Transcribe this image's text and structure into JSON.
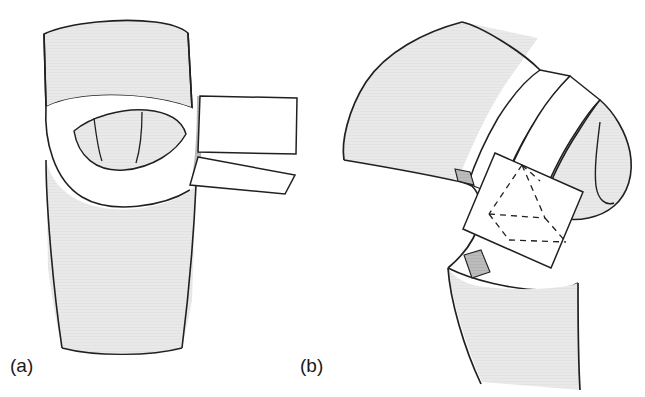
{
  "figure": {
    "type": "line-drawing",
    "width": 645,
    "height": 397,
    "background_color": "#ffffff",
    "panels": [
      {
        "id": "a",
        "label": "(a)",
        "label_x": 10,
        "label_y": 372,
        "view": "frontal-extended-knee"
      },
      {
        "id": "b",
        "label": "(b)",
        "label_x": 300,
        "label_y": 372,
        "view": "lateral-flexed-knee"
      }
    ],
    "colors": {
      "outline": "#231f20",
      "bone_fill": "#e8e8e8",
      "shadow_fill": "#b8b8b8",
      "flap_fill": "#ffffff",
      "guide_fill": "#ffffff",
      "dashed_stroke": "#231f20",
      "caption_color": "#1a1a1a"
    },
    "stroke_widths": {
      "outline": 1.6,
      "inner": 1.4,
      "dashed": 1.4
    },
    "panel_a_parts": [
      {
        "name": "femur-shaft-upper",
        "fill": "bone_fill"
      },
      {
        "name": "capsule-opening",
        "fill": "flap_fill"
      },
      {
        "name": "intercondylar-eye",
        "fill": "bone_fill"
      },
      {
        "name": "eye-inner-line-left",
        "fill": "none"
      },
      {
        "name": "eye-inner-line-right",
        "fill": "none"
      },
      {
        "name": "tibia-shaft-lower",
        "fill": "bone_fill"
      },
      {
        "name": "retractor-flap-upper",
        "fill": "flap_fill"
      },
      {
        "name": "retractor-flap-lower",
        "fill": "flap_fill"
      },
      {
        "name": "shadow-sliver",
        "fill": "shadow_fill"
      }
    ],
    "panel_b_parts": [
      {
        "name": "femur-condyle-mass",
        "fill": "bone_fill"
      },
      {
        "name": "resection-band-upper",
        "fill": "flap_fill"
      },
      {
        "name": "resection-band-lower",
        "fill": "flap_fill"
      },
      {
        "name": "posterior-condyle",
        "fill": "bone_fill"
      },
      {
        "name": "condyle-hook-line",
        "fill": "none"
      },
      {
        "name": "tibia-shaft-lower",
        "fill": "bone_fill"
      },
      {
        "name": "cutting-guide-plate",
        "fill": "guide_fill"
      },
      {
        "name": "dashed-wedge-outline",
        "fill": "none"
      },
      {
        "name": "marker-tab-upper",
        "fill": "shadow_fill"
      },
      {
        "name": "marker-tab-lower",
        "fill": "shadow_fill"
      }
    ]
  }
}
